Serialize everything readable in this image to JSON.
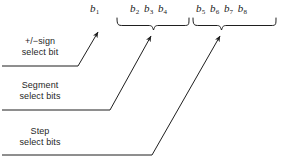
{
  "figure": {
    "type": "bit-field-allocation-diagram",
    "background_color": "#ffffff",
    "ink_color": "#1f1f1f"
  },
  "bit_groups": [
    {
      "id": "sign",
      "bits": [
        "b1"
      ],
      "subscripts": [
        "1"
      ],
      "base": "b",
      "has_brace": false
    },
    {
      "id": "segment",
      "bits": [
        "b2",
        "b3",
        "b4"
      ],
      "subscripts": [
        "2",
        "3",
        "4"
      ],
      "base": "b",
      "has_brace": true
    },
    {
      "id": "step",
      "bits": [
        "b5",
        "b6",
        "b7",
        "b8"
      ],
      "subscripts": [
        "5",
        "6",
        "7",
        "8"
      ],
      "base": "b",
      "has_brace": true
    }
  ],
  "labels": [
    {
      "id": "sign",
      "line1": "+/−sign",
      "line2": "select bit"
    },
    {
      "id": "segment",
      "line1": "Segment",
      "line2": "select bits"
    },
    {
      "id": "step",
      "line1": "Step",
      "line2": "select bits"
    }
  ]
}
